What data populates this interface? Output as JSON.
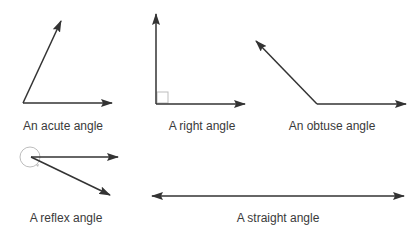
{
  "diagram": {
    "colors": {
      "line": "#333333",
      "marker": "#bdbdbd",
      "text": "#3a3a3a",
      "background": "#ffffff"
    },
    "angles": [
      {
        "id": "acute",
        "label": "An acute angle",
        "label_pos": [
          63,
          119
        ],
        "vertex": [
          23,
          103
        ],
        "rays": [
          [
            112,
            103
          ],
          [
            61,
            21
          ]
        ]
      },
      {
        "id": "right",
        "label": "A right angle",
        "label_pos": [
          202,
          119
        ],
        "vertex": [
          156,
          104
        ],
        "rays": [
          [
            245,
            104
          ],
          [
            156,
            14
          ]
        ],
        "marker": "square"
      },
      {
        "id": "obtuse",
        "label": "An obtuse angle",
        "label_pos": [
          332,
          119
        ],
        "vertex": [
          317,
          104
        ],
        "rays": [
          [
            406,
            104
          ],
          [
            256,
            41
          ]
        ]
      },
      {
        "id": "reflex",
        "label": "A reflex angle",
        "label_pos": [
          66,
          211
        ],
        "vertex": [
          31,
          157
        ],
        "rays": [
          [
            118,
            157
          ],
          [
            110,
            195
          ]
        ],
        "marker": "circle"
      },
      {
        "id": "straight",
        "label": "A straight angle",
        "label_pos": [
          278,
          211
        ],
        "rays": [
          [
            152,
            196
          ],
          [
            404,
            196
          ]
        ]
      }
    ]
  }
}
